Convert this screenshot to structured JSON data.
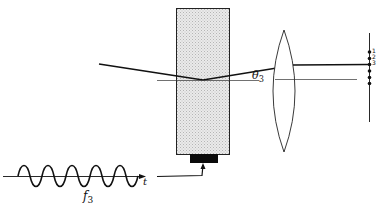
{
  "diagram": {
    "type": "acousto-optic deflector schematic",
    "labels": {
      "angle_symbol": "θ",
      "angle_subscript": "3",
      "frequency_symbol": "f",
      "frequency_subscript": "3",
      "time_axis": "t"
    },
    "spot_labels": [
      "1",
      "2",
      "3"
    ],
    "components": [
      "input-beam",
      "acousto-optic-crystal",
      "transducer",
      "rf-signal-wave",
      "lens",
      "output-plane-spots"
    ],
    "colors": {
      "line": "#111111",
      "crystal_fill": "#e2e2e2",
      "transducer": "#0a0a0a"
    }
  }
}
